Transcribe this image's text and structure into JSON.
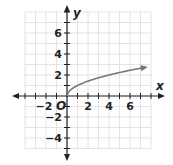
{
  "chart_data": {
    "type": "line",
    "title": "",
    "xlabel": "x",
    "ylabel": "y",
    "origin_label": "O",
    "xlim": [
      -4,
      8
    ],
    "ylim": [
      -5,
      8
    ],
    "grid": true,
    "x_ticks": [
      -2,
      2,
      4,
      6
    ],
    "y_ticks": [
      -4,
      -2,
      2,
      4,
      6
    ],
    "x_tick_labels": [
      "−2",
      "2",
      "4",
      "6"
    ],
    "y_tick_labels": [
      "−4",
      "−2",
      "2",
      "4",
      "6"
    ],
    "series": [
      {
        "name": "y = √x",
        "x": [
          0,
          0.25,
          0.5,
          1,
          2,
          3,
          4,
          5,
          6,
          7,
          7.5
        ],
        "y": [
          0,
          0.5,
          0.71,
          1,
          1.41,
          1.73,
          2,
          2.24,
          2.45,
          2.65,
          2.74
        ],
        "end_arrow": true
      }
    ],
    "colors": {
      "curve": "#777777",
      "axes": "#222222",
      "grid": "#dddddd"
    }
  }
}
